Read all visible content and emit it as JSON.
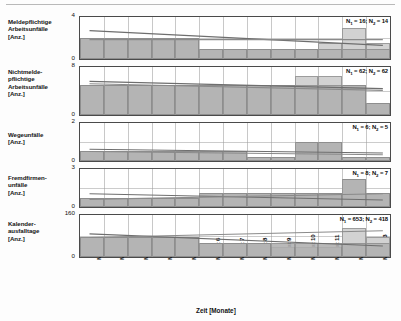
{
  "chart_data": {
    "type": "bar",
    "title": "",
    "xlabel": "Zeit [Monate]",
    "grid": true,
    "legend_position": "none",
    "categories": [
      "Monat 1",
      "Monat 2",
      "Monat 3",
      "Monat 4",
      "Monat 5",
      "Monat 6",
      "Monat 7",
      "Monat 8",
      "Monat 9",
      "Monat 10",
      "Monat 11",
      "Monat 12",
      "Monat 13"
    ],
    "panels": [
      {
        "ylabel": "Meldepflichtige Arbeitsunfälle [Anz.]",
        "ylim": [
          0,
          4
        ],
        "yticks": [
          "4",
          "0"
        ],
        "annotation": "N1 = 16; N2 = 14",
        "n1": 16,
        "n2": 14,
        "series": [
          {
            "name": "Zeitraum 1",
            "values": [
              2,
              2,
              2,
              2,
              2,
              1,
              1,
              1,
              1,
              1,
              1,
              1,
              1
            ]
          },
          {
            "name": "Zeitraum 2",
            "values": [
              2,
              2,
              2,
              2,
              2,
              1,
              1,
              1,
              1,
              1,
              1.5,
              3,
              1.5
            ]
          }
        ],
        "trend1": [
          2.7,
          1.3
        ],
        "trend2": [
          1.85,
          1.85
        ]
      },
      {
        "ylabel": "Nichtmeldepflichtige Arbeitsunfälle [Anz.]",
        "ylim": [
          0,
          8
        ],
        "yticks": [
          "8",
          "0"
        ],
        "annotation": "N1 = 62; N2 = 62",
        "n1": 62,
        "n2": 62,
        "series": [
          {
            "name": "Zeitraum 1",
            "values": [
              5,
              5,
              5,
              5,
              5,
              5,
              5,
              5,
              5,
              5,
              5,
              5,
              2
            ]
          },
          {
            "name": "Zeitraum 2",
            "values": [
              5,
              5,
              5,
              5,
              5,
              5,
              5,
              5,
              5,
              6.5,
              6.5,
              5,
              2
            ]
          }
        ],
        "trend1": [
          5.6,
          4.4
        ],
        "trend2": [
          5.2,
          4.1
        ]
      },
      {
        "ylabel": "Wegeunfälle [Anz.]",
        "ylim": [
          0,
          2
        ],
        "yticks": [
          "2",
          "0"
        ],
        "annotation": "N1 = 6; N2 = 5",
        "n1": 6,
        "n2": 5,
        "series": [
          {
            "name": "Zeitraum 1",
            "values": [
              0.55,
              0.55,
              0.55,
              0.55,
              0.55,
              0.55,
              0.55,
              0.2,
              0.2,
              1.0,
              1.0,
              0.2,
              0.2
            ]
          },
          {
            "name": "Zeitraum 2",
            "values": [
              0.55,
              0.55,
              0.55,
              0.55,
              0.55,
              0.55,
              0.55,
              0.2,
              0.2,
              1.0,
              1.0,
              0.2,
              0.2
            ]
          }
        ],
        "trend1": [
          0.62,
          0.42
        ],
        "trend2": [
          0.5,
          0.33
        ]
      },
      {
        "ylabel": "Fremdfirmenunfälle [Anz.]",
        "ylim": [
          0,
          3
        ],
        "yticks": [
          "3",
          "0"
        ],
        "annotation": "N1 = 8; N2 = 7",
        "n1": 8,
        "n2": 7,
        "series": [
          {
            "name": "Zeitraum 1",
            "values": [
              0.7,
              0.7,
              0.7,
              0.7,
              0.7,
              1.1,
              1.1,
              1.1,
              1.1,
              1.1,
              1.1,
              2.2,
              1.1
            ]
          },
          {
            "name": "Zeitraum 2",
            "values": [
              0.7,
              0.7,
              0.7,
              0.7,
              0.7,
              1.1,
              1.1,
              1.1,
              1.1,
              1.1,
              1.1,
              2.2,
              1.1
            ]
          }
        ],
        "trend1": [
          1.05,
          0.55
        ],
        "trend2": [
          0.6,
          1.05
        ]
      },
      {
        "ylabel": "Kalenderausfalltage [Anz.]",
        "ylim": [
          0,
          160
        ],
        "yticks": [
          "160",
          "0"
        ],
        "annotation": "N1 = 653; N2 = 418",
        "n1": 653,
        "n2": 418,
        "series": [
          {
            "name": "Zeitraum 1",
            "values": [
              78,
              78,
              78,
              78,
              78,
              52,
              52,
              52,
              52,
              52,
              52,
              52,
              52
            ]
          },
          {
            "name": "Zeitraum 2",
            "values": [
              78,
              78,
              78,
              78,
              78,
              52,
              52,
              52,
              40,
              40,
              40,
              110,
              75
            ]
          }
        ],
        "trend1": [
          88,
          42
        ],
        "trend2": [
          74,
          100
        ]
      }
    ]
  },
  "axis": {
    "x_label": "Zeit [Monate]"
  },
  "labels": {
    "row1": "Meldepflichtige\nArbeitsunfälle\n[Anz.]",
    "row2": "Nichtmelde-\npflichtige\nArbeitsunfälle\n[Anz.]",
    "row3": "Wegeunfälle\n[Anz.]",
    "row4": "Fremdfirmen-\nunfälle\n[Anz.]",
    "row5": "Kalender-\nausfalltage\n[Anz.]"
  },
  "colors": {
    "series1": "#b0b0b0",
    "series2": "#d2d2d2",
    "trend1": "#6e6e6e",
    "trend2": "#8a8a8a",
    "frame": "#4a4a4a",
    "grid": "#9a9a9a"
  }
}
